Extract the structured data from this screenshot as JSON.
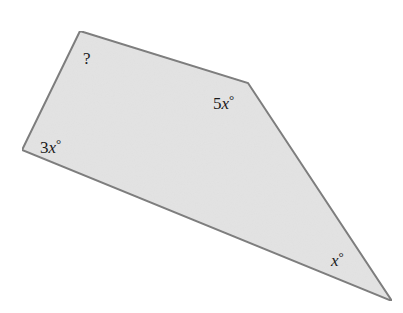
{
  "diagram": {
    "type": "quadrilateral",
    "colors": {
      "fill": "#e3e3e3",
      "stroke": "#7a7a7a",
      "text": "#1a1a1a",
      "background": "#ffffff"
    },
    "vertices": [
      {
        "name": "top",
        "x": 80,
        "y": 31
      },
      {
        "name": "right-top",
        "x": 248,
        "y": 83
      },
      {
        "name": "bottom-right",
        "x": 392,
        "y": 301
      },
      {
        "name": "left",
        "x": 22,
        "y": 150
      }
    ],
    "angle_labels": {
      "top": {
        "coef": "?",
        "var": "",
        "deg": ""
      },
      "left": {
        "coef": "3",
        "var": "x",
        "deg": "°"
      },
      "right_top": {
        "coef": "5",
        "var": "x",
        "deg": "°"
      },
      "bottom_right": {
        "coef": "",
        "var": "x",
        "deg": "°"
      }
    }
  }
}
